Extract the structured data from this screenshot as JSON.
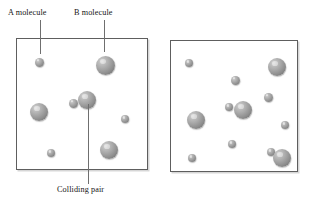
{
  "figure": {
    "type": "molecular-collision-diagram",
    "background_color": "#ffffff",
    "molecule_color": "#9a9a9a",
    "border_color": "#5e5e5e",
    "leader_color": "#6f6f6f"
  },
  "labels": [
    {
      "id": "a-molecule",
      "text": "A molecule",
      "x": 8,
      "y": 9,
      "leader": {
        "x": 40,
        "y": 20,
        "height": 34
      }
    },
    {
      "id": "b-molecule",
      "text": "B molecule",
      "x": 74,
      "y": 9,
      "leader": {
        "x": 104,
        "y": 20,
        "height": 32
      }
    },
    {
      "id": "colliding-pair",
      "text": "Colliding pair",
      "x": 57,
      "y": 186,
      "leader": {
        "x": 88,
        "y": 104,
        "height": 80
      }
    }
  ],
  "boxes": [
    {
      "id": "left-box",
      "name": "low-concentration-container",
      "x": 16,
      "y": 38,
      "width": 132,
      "height": 132,
      "molecules": [
        {
          "id": "l1",
          "kind": "A",
          "cx": 39,
          "cy": 62,
          "d": 9
        },
        {
          "id": "l2",
          "kind": "B",
          "cx": 105,
          "cy": 65,
          "d": 19
        },
        {
          "id": "l3",
          "kind": "B",
          "cx": 39,
          "cy": 112,
          "d": 18
        },
        {
          "id": "l4",
          "kind": "A",
          "cx": 73,
          "cy": 103,
          "d": 9
        },
        {
          "id": "l5",
          "kind": "B",
          "cx": 87,
          "cy": 100,
          "d": 18
        },
        {
          "id": "l6",
          "kind": "A",
          "cx": 125,
          "cy": 119,
          "d": 8
        },
        {
          "id": "l7",
          "kind": "A",
          "cx": 51,
          "cy": 153,
          "d": 8
        },
        {
          "id": "l8",
          "kind": "B",
          "cx": 109,
          "cy": 150,
          "d": 18
        }
      ],
      "collision_count": 1
    },
    {
      "id": "right-box",
      "name": "high-concentration-container",
      "x": 170,
      "y": 40,
      "width": 128,
      "height": 132,
      "molecules": [
        {
          "id": "r1",
          "kind": "A",
          "cx": 189,
          "cy": 63,
          "d": 8
        },
        {
          "id": "r2",
          "kind": "B",
          "cx": 277,
          "cy": 67,
          "d": 18
        },
        {
          "id": "r3",
          "kind": "A",
          "cx": 235,
          "cy": 80,
          "d": 9
        },
        {
          "id": "r4",
          "kind": "A",
          "cx": 268,
          "cy": 97,
          "d": 9
        },
        {
          "id": "r5",
          "kind": "A",
          "cx": 229,
          "cy": 107,
          "d": 8
        },
        {
          "id": "r6",
          "kind": "B",
          "cx": 243,
          "cy": 110,
          "d": 18
        },
        {
          "id": "r7",
          "kind": "B",
          "cx": 196,
          "cy": 120,
          "d": 18
        },
        {
          "id": "r8",
          "kind": "A",
          "cx": 285,
          "cy": 125,
          "d": 8
        },
        {
          "id": "r9",
          "kind": "A",
          "cx": 232,
          "cy": 144,
          "d": 8
        },
        {
          "id": "r10",
          "kind": "A",
          "cx": 271,
          "cy": 152,
          "d": 8
        },
        {
          "id": "r11",
          "kind": "A",
          "cx": 192,
          "cy": 158,
          "d": 8
        },
        {
          "id": "r12",
          "kind": "B",
          "cx": 282,
          "cy": 158,
          "d": 18
        }
      ],
      "collision_count": 2
    }
  ]
}
